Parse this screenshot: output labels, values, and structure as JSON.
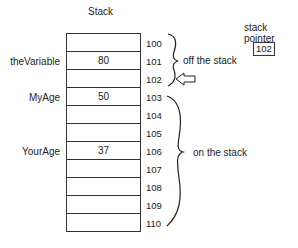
{
  "title": "Stack",
  "stack": {
    "rows": [
      {
        "address": "100",
        "value": "",
        "label": ""
      },
      {
        "address": "101",
        "value": "80",
        "label": "theVariable"
      },
      {
        "address": "102",
        "value": "",
        "label": ""
      },
      {
        "address": "103",
        "value": "50",
        "label": "MyAge"
      },
      {
        "address": "104",
        "value": "",
        "label": ""
      },
      {
        "address": "105",
        "value": "",
        "label": ""
      },
      {
        "address": "106",
        "value": "37",
        "label": "YourAge"
      },
      {
        "address": "107",
        "value": "",
        "label": ""
      },
      {
        "address": "108",
        "value": "",
        "label": ""
      },
      {
        "address": "109",
        "value": "",
        "label": ""
      },
      {
        "address": "110",
        "value": "",
        "label": ""
      }
    ]
  },
  "annotations": {
    "off_stack": "off the stack",
    "on_stack": "on the stack"
  },
  "stack_pointer": {
    "label": "stack pointer",
    "value": "102"
  }
}
